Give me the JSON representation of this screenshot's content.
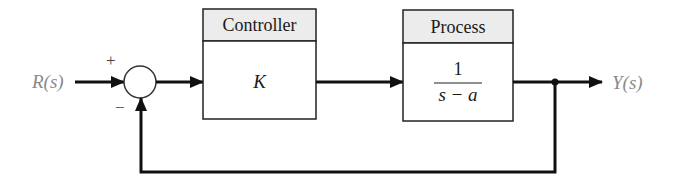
{
  "diagram": {
    "type": "feedback-control-block-diagram",
    "input": {
      "label": "R(s)"
    },
    "output": {
      "label": "Y(s)"
    },
    "summing_junction": {
      "signs": {
        "top": "+",
        "bottom": "−"
      }
    },
    "blocks": [
      {
        "id": "controller",
        "header": "Controller",
        "transfer_function": "K"
      },
      {
        "id": "process",
        "header": "Process",
        "numerator": "1",
        "denominator": "s − a"
      }
    ],
    "feedback": {
      "type": "unity",
      "sign": "negative"
    },
    "colors": {
      "line": "#111111",
      "header_fill": "#ececec",
      "body_fill": "#ffffff",
      "signal_label": "#8a8a8a"
    }
  }
}
